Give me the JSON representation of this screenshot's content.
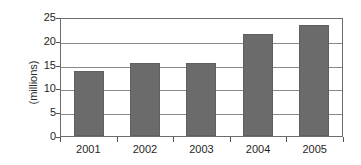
{
  "chart_data": {
    "type": "bar",
    "title": "",
    "subtitle": "",
    "xlabel": "",
    "ylabel": "(millions)",
    "categories": [
      "2001",
      "2002",
      "2003",
      "2004",
      "2005"
    ],
    "values": [
      13.7,
      15.3,
      15.3,
      21.5,
      23.3
    ],
    "series": [
      {
        "name": "",
        "values": [
          13.7,
          15.3,
          15.3,
          21.5,
          23.3
        ]
      }
    ],
    "ylim": [
      0,
      25
    ],
    "yticks": [
      0,
      5,
      10,
      15,
      20,
      25
    ],
    "ytick_labels": [
      "0",
      "5",
      "10",
      "15",
      "20",
      "25"
    ],
    "xtick_labels": [
      "2001",
      "2002",
      "2003",
      "2004",
      "2005"
    ],
    "grid": true,
    "grid_axis": "y",
    "legend": false,
    "legend_position": "none",
    "bar_color": "#6b6b6b",
    "grid_color": "#8a8a8a",
    "axis_color": "#6d6d6d",
    "background_color": "#ffffff",
    "text_color": "#1f1f1f",
    "annotations": []
  }
}
